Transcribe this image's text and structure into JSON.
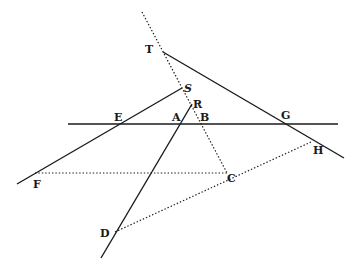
{
  "diagram": {
    "type": "geometric-figure",
    "labels": {
      "T": "T",
      "S": "S",
      "R": "R",
      "E": "E",
      "A": "A",
      "B": "B",
      "G": "G",
      "H": "H",
      "F": "F",
      "C": "C",
      "D": "D"
    },
    "points": {
      "T": [
        163,
        52
      ],
      "S": [
        182,
        88
      ],
      "R": [
        192,
        104
      ],
      "E": [
        120,
        123
      ],
      "A": [
        180,
        123
      ],
      "B": [
        200,
        123
      ],
      "G": [
        285,
        124
      ],
      "H": [
        311,
        142
      ],
      "F": [
        35,
        173
      ],
      "C": [
        227,
        173
      ],
      "D": [
        115,
        232
      ]
    },
    "solid_lines": [
      {
        "name": "horizontal-line",
        "from": "E-left",
        "to": "right"
      },
      {
        "name": "line-TG",
        "from": "T",
        "to": "beyond-G"
      },
      {
        "name": "line-SF",
        "from": "S",
        "to": "beyond-F"
      },
      {
        "name": "line-RD",
        "from": "R",
        "to": "beyond-D"
      }
    ],
    "dotted_lines": [
      {
        "name": "line-top-to-C",
        "through": [
          "T",
          "S",
          "B"
        ],
        "to": "C"
      },
      {
        "name": "line-FC",
        "from": "F",
        "to": "C"
      },
      {
        "name": "line-DH",
        "from": "D",
        "through": "C",
        "to": "H"
      }
    ]
  }
}
